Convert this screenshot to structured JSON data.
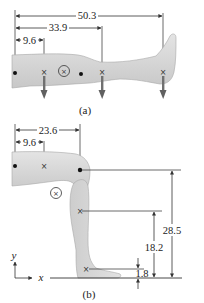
{
  "figure_a": {
    "caption": "(a)",
    "dimensions": [
      {
        "label": "50.3",
        "kind": "horizontal"
      },
      {
        "label": "33.9",
        "kind": "horizontal"
      },
      {
        "label": "9.6",
        "kind": "horizontal"
      }
    ],
    "markers": [
      "hip-joint-dot",
      "thigh-cm-x",
      "body-cm-circled-x",
      "knee-joint-dot",
      "shank-cm-x",
      "foot-cm-x"
    ],
    "forces": 3
  },
  "figure_b": {
    "caption": "(b)",
    "dimensions": [
      {
        "label": "23.6",
        "kind": "horizontal"
      },
      {
        "label": "9.6",
        "kind": "horizontal"
      },
      {
        "label": "28.5",
        "kind": "vertical"
      },
      {
        "label": "18.2",
        "kind": "vertical"
      },
      {
        "label": "1.8",
        "kind": "vertical"
      }
    ],
    "axes": {
      "x": "x",
      "y": "y"
    }
  },
  "colors": {
    "leg_fill": "#d9d9d9",
    "leg_stroke": "#9a9a9a",
    "line": "#333333",
    "arrow": "#707070"
  }
}
